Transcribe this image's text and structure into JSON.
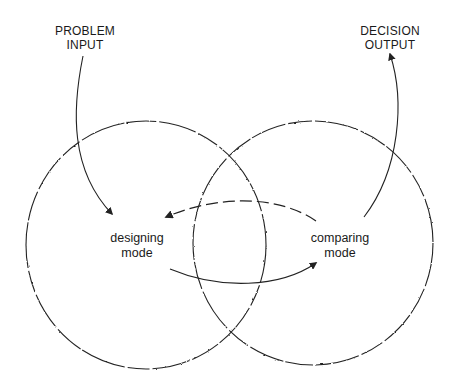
{
  "diagram": {
    "input_label": {
      "line1": "PROBLEM",
      "line2": "INPUT"
    },
    "output_label": {
      "line1": "DECISION",
      "line2": "OUTPUT"
    },
    "left_mode": {
      "line1": "designing",
      "line2": "mode"
    },
    "right_mode": {
      "line1": "comparing",
      "line2": "mode"
    },
    "colors": {
      "stroke": "#222222",
      "background": "#ffffff"
    },
    "circles": [
      {
        "name": "designing-circle",
        "cx": 146,
        "cy": 245,
        "rx": 120,
        "ry": 124,
        "style": "wavy-dashed"
      },
      {
        "name": "comparing-circle",
        "cx": 313,
        "cy": 243,
        "rx": 120,
        "ry": 122,
        "style": "wavy-dashed"
      }
    ],
    "arrows": [
      {
        "name": "problem-input-arrow",
        "from": "PROBLEM INPUT",
        "to": "designing mode",
        "style": "solid"
      },
      {
        "name": "designing-to-comparing-arrow",
        "from": "designing mode",
        "to": "comparing mode",
        "style": "solid"
      },
      {
        "name": "comparing-to-designing-arrow",
        "from": "comparing mode",
        "to": "designing mode",
        "style": "dashed"
      },
      {
        "name": "decision-output-arrow",
        "from": "comparing mode",
        "to": "DECISION OUTPUT",
        "style": "solid"
      }
    ]
  }
}
